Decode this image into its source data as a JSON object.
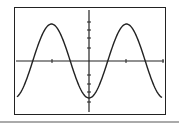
{
  "calculator_graph": {
    "function": "y = -cos(x)",
    "window": {
      "xmin": -6.28,
      "xmax": 6.28,
      "ymin": -1.3,
      "ymax": 1.3
    },
    "x_ticks": 4,
    "y_ticks_per_side": 5
  },
  "colors": {
    "curve": "#222222",
    "axes": "#222222",
    "frame": "#222222",
    "background": "#ffffff"
  }
}
